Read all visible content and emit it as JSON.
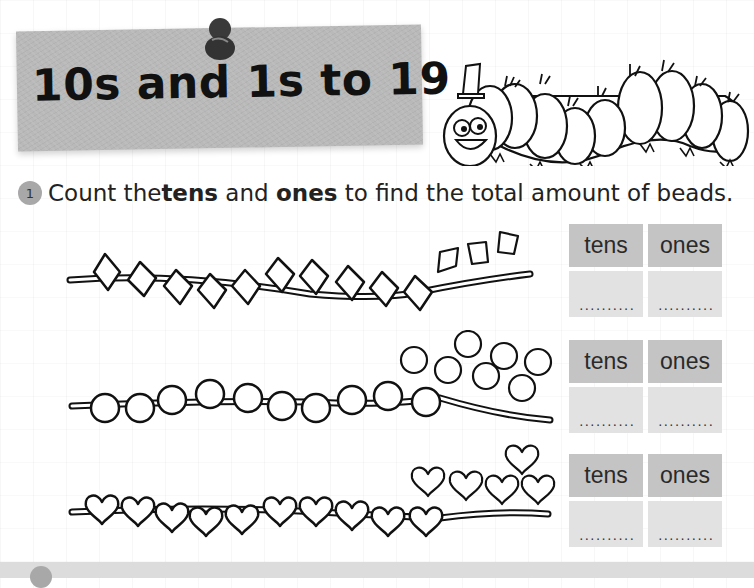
{
  "title": "10s and 1s to 19",
  "question": {
    "number": "1",
    "text_before": "Count the ",
    "bold_1": "tens",
    "text_middle": " and ",
    "bold_2": "ones",
    "text_after": " to find the total amount of beads."
  },
  "rows": [
    {
      "bead_shape": "diamond",
      "strung": 10,
      "loose": 3,
      "tens_label": "tens",
      "ones_label": "ones",
      "tens_answer": "..........",
      "ones_answer": ".........."
    },
    {
      "bead_shape": "circle",
      "strung": 10,
      "loose": 7,
      "tens_label": "tens",
      "ones_label": "ones",
      "tens_answer": "..........",
      "ones_answer": ".........."
    },
    {
      "bead_shape": "heart",
      "strung": 10,
      "loose": 5,
      "tens_label": "tens",
      "ones_label": "ones",
      "tens_answer": "..........",
      "ones_answer": ".........."
    }
  ],
  "colors": {
    "banner": "#b9b9b9",
    "table_header": "#c4c4c4",
    "table_answer": "#e2e2e2",
    "number_badge": "#a8a8a8"
  }
}
